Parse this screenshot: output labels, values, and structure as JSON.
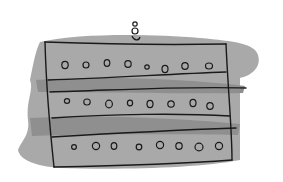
{
  "illustration": {
    "description": "Hand-drawn sketch of a rectangular building-like block with three rows of small circular windows on grey wash bands, with a small figure on top",
    "colors": {
      "background": "#ffffff",
      "wash_light": "#a8a8a8",
      "wash_dark": "#8e8e8e",
      "ink": "#1a1a1a"
    },
    "rows": [
      {
        "circles": 8
      },
      {
        "circles": 8
      },
      {
        "circles": 8
      }
    ]
  }
}
